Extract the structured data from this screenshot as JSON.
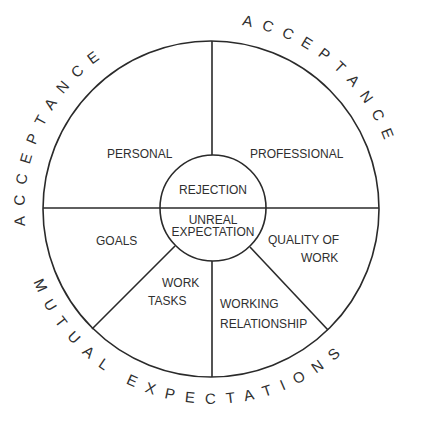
{
  "diagram": {
    "outer_ring_labels": {
      "top_left": "ACCEPTANCE",
      "top_right": "ACCEPTANCE",
      "bottom": "MUTUAL EXPECTATIONS"
    },
    "center": {
      "upper": "REJECTION",
      "lower_line1": "UNREAL",
      "lower_line2": "EXPECTATION"
    },
    "segments": {
      "personal": "PERSONAL",
      "professional": "PROFESSIONAL",
      "goals": "GOALS",
      "quality_line1": "QUALITY OF",
      "quality_line2": "WORK",
      "work_tasks_line1": "WORK",
      "work_tasks_line2": "TASKS",
      "working_rel_line1": "WORKING",
      "working_rel_line2": "RELATIONSHIP"
    },
    "colors": {
      "line": "#2a2a2a",
      "text": "#2f2f2f",
      "background": "#ffffff"
    }
  }
}
